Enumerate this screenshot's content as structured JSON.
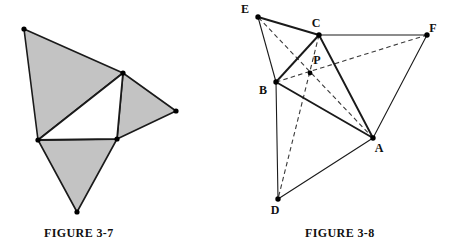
{
  "page": {
    "background_color": "#ffffff",
    "width": 459,
    "height": 252
  },
  "figures": [
    {
      "id": "figure-3-7",
      "caption": "FIGURE 3-7",
      "description": "Central white triangle with three shaded gray triangles erected outward on its sides",
      "fill_color": "#c3c3c3",
      "stroke_color": "#1a1a1a",
      "vertices": {
        "inner_top": [
          123,
          73
        ],
        "inner_left": [
          38,
          140
        ],
        "inner_right": [
          117,
          139
        ],
        "outer_top_left": [
          24,
          29
        ],
        "outer_right": [
          176,
          111
        ],
        "outer_bottom": [
          77,
          212
        ]
      },
      "shaded_triangles": [
        [
          "outer_top_left",
          "inner_top",
          "inner_left"
        ],
        [
          "inner_top",
          "outer_right",
          "inner_right"
        ],
        [
          "inner_left",
          "inner_right",
          "outer_bottom"
        ]
      ],
      "inner_triangle": [
        "inner_top",
        "inner_left",
        "inner_right"
      ]
    },
    {
      "id": "figure-3-8",
      "caption": "FIGURE 3-8",
      "description": "Triangle ABC with outer triangles on each side and concurrent cevians meeting at point P",
      "stroke_color": "#1a1a1a",
      "dash_color": "#3a3a3a",
      "points": [
        {
          "name": "A",
          "x": 148,
          "y": 138,
          "label": "A",
          "label_dx": 6,
          "label_dy": 14
        },
        {
          "name": "B",
          "x": 51,
          "y": 82,
          "label": "B",
          "label_dx": -13,
          "label_dy": 12
        },
        {
          "name": "C",
          "x": 94,
          "y": 35,
          "label": "C",
          "label_dx": -3,
          "label_dy": -8
        },
        {
          "name": "D",
          "x": 53,
          "y": 199,
          "label": "D",
          "label_dx": -3,
          "label_dy": 15
        },
        {
          "name": "E",
          "x": 33,
          "y": 17,
          "label": "E",
          "label_dx": -13,
          "label_dy": -4
        },
        {
          "name": "F",
          "x": 202,
          "y": 35,
          "label": "F",
          "label_dx": 6,
          "label_dy": -3
        },
        {
          "name": "P",
          "x": 85,
          "y": 73,
          "label": "P",
          "label_dx": 7,
          "label_dy": -9
        }
      ],
      "solid_segments": [
        [
          "A",
          "B"
        ],
        [
          "B",
          "C"
        ],
        [
          "C",
          "A"
        ],
        [
          "E",
          "C"
        ],
        [
          "E",
          "B"
        ],
        [
          "C",
          "F"
        ],
        [
          "F",
          "A"
        ],
        [
          "B",
          "D"
        ],
        [
          "D",
          "A"
        ]
      ],
      "dashed_segments": [
        [
          "A",
          "E"
        ],
        [
          "B",
          "F"
        ],
        [
          "C",
          "D"
        ]
      ]
    }
  ]
}
